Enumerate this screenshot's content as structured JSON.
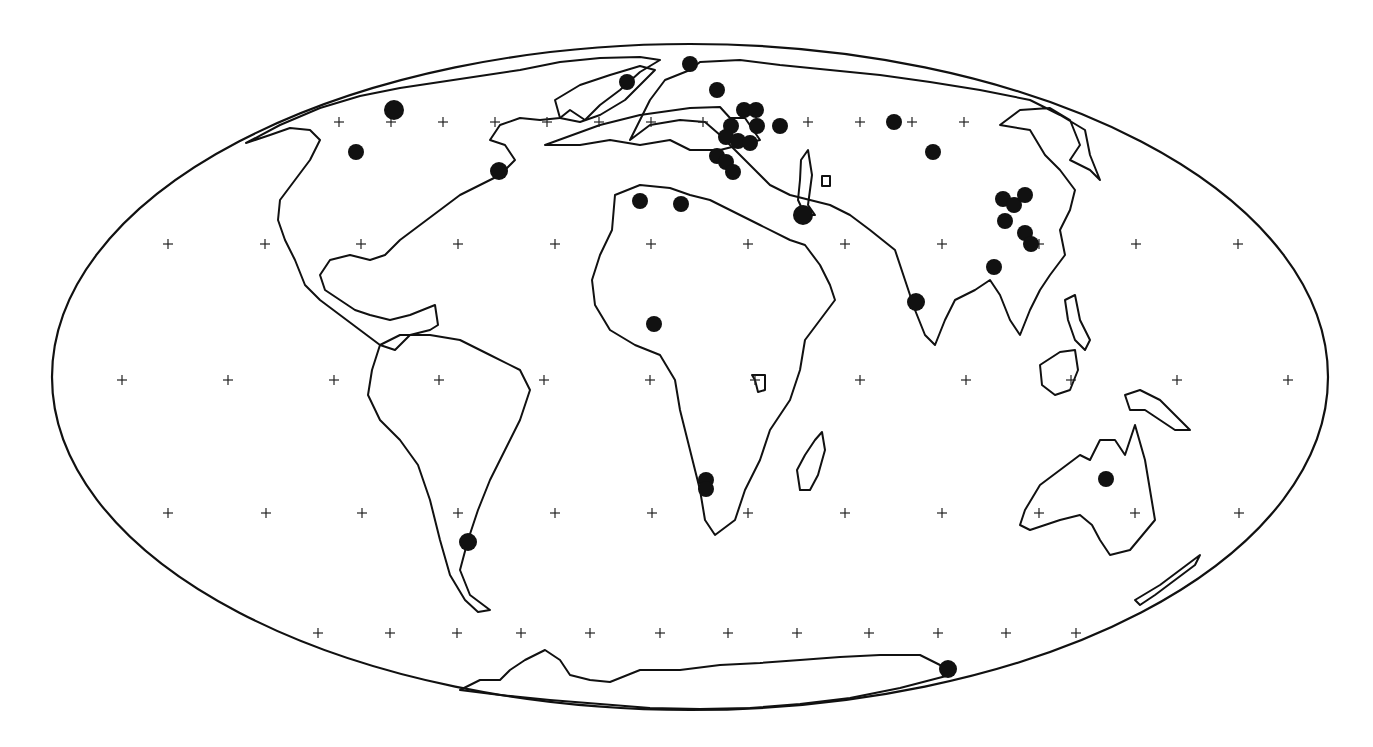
{
  "map": {
    "projection": "Mollweide",
    "width": 1373,
    "height": 747,
    "background": "#ffffff",
    "ink_color": "#111111",
    "outline": {
      "cx": 690,
      "cy": 377,
      "rx": 638,
      "ry": 333
    },
    "graticule_markers": {
      "rows": [
        {
          "y": 122,
          "x": [
            339,
            391,
            443,
            495,
            547,
            599,
            651,
            703,
            756,
            808,
            860,
            912,
            964
          ]
        },
        {
          "y": 244,
          "x": [
            168,
            265,
            361,
            458,
            555,
            651,
            748,
            845,
            942,
            1039,
            1136,
            1238
          ]
        },
        {
          "y": 380,
          "x": [
            122,
            228,
            334,
            439,
            544,
            650,
            755,
            860,
            966,
            1071,
            1177,
            1288
          ]
        },
        {
          "y": 513,
          "x": [
            168,
            266,
            362,
            458,
            555,
            652,
            748,
            845,
            942,
            1039,
            1135,
            1239
          ]
        },
        {
          "y": 633,
          "x": [
            318,
            390,
            457,
            521,
            590,
            660,
            728,
            797,
            869,
            938,
            1006,
            1076
          ]
        }
      ]
    },
    "sites": [
      {
        "region": "Alaska/NW Canada",
        "x": 394,
        "y": 110,
        "r": 10
      },
      {
        "region": "Western Canada",
        "x": 356,
        "y": 152,
        "r": 8
      },
      {
        "region": "Eastern Canada",
        "x": 499,
        "y": 171,
        "r": 9
      },
      {
        "region": "Greenland",
        "x": 627,
        "y": 82,
        "r": 8
      },
      {
        "region": "Svalbard",
        "x": 690,
        "y": 64,
        "r": 8
      },
      {
        "region": "Scandinavia",
        "x": 717,
        "y": 90,
        "r": 8
      },
      {
        "region": "Russia W1",
        "x": 744,
        "y": 110,
        "r": 8
      },
      {
        "region": "Russia W2",
        "x": 756,
        "y": 110,
        "r": 8
      },
      {
        "region": "Baltic 1",
        "x": 731,
        "y": 126,
        "r": 8
      },
      {
        "region": "Russia W3",
        "x": 757,
        "y": 126,
        "r": 8
      },
      {
        "region": "Moscow area",
        "x": 780,
        "y": 126,
        "r": 8
      },
      {
        "region": "Baltic 2",
        "x": 726,
        "y": 137,
        "r": 8
      },
      {
        "region": "Baltic 3",
        "x": 738,
        "y": 141,
        "r": 8
      },
      {
        "region": "Russia W4",
        "x": 750,
        "y": 143,
        "r": 8
      },
      {
        "region": "Ukraine 1",
        "x": 717,
        "y": 156,
        "r": 8
      },
      {
        "region": "Ukraine 2",
        "x": 726,
        "y": 162,
        "r": 8
      },
      {
        "region": "Ukraine 3",
        "x": 733,
        "y": 172,
        "r": 8
      },
      {
        "region": "Spain",
        "x": 640,
        "y": 201,
        "r": 8
      },
      {
        "region": "Italy/Tunisia",
        "x": 681,
        "y": 204,
        "r": 8
      },
      {
        "region": "Caspian/Iran",
        "x": 803,
        "y": 215,
        "r": 10
      },
      {
        "region": "West Siberia",
        "x": 894,
        "y": 122,
        "r": 8
      },
      {
        "region": "Central Siberia",
        "x": 933,
        "y": 152,
        "r": 8
      },
      {
        "region": "North China 1",
        "x": 1003,
        "y": 199,
        "r": 8
      },
      {
        "region": "North China 2",
        "x": 1014,
        "y": 205,
        "r": 8
      },
      {
        "region": "NE China",
        "x": 1025,
        "y": 195,
        "r": 8
      },
      {
        "region": "China central",
        "x": 1005,
        "y": 221,
        "r": 8
      },
      {
        "region": "East China 1",
        "x": 1025,
        "y": 233,
        "r": 8
      },
      {
        "region": "East China 2",
        "x": 1031,
        "y": 244,
        "r": 8
      },
      {
        "region": "South China",
        "x": 994,
        "y": 267,
        "r": 8
      },
      {
        "region": "India",
        "x": 916,
        "y": 302,
        "r": 9
      },
      {
        "region": "West Africa",
        "x": 654,
        "y": 324,
        "r": 8
      },
      {
        "region": "Namibia 1",
        "x": 706,
        "y": 480,
        "r": 8
      },
      {
        "region": "Namibia 2",
        "x": 706,
        "y": 489,
        "r": 8
      },
      {
        "region": "Australia",
        "x": 1106,
        "y": 479,
        "r": 8
      },
      {
        "region": "Argentina",
        "x": 468,
        "y": 542,
        "r": 9
      },
      {
        "region": "Antarctica",
        "x": 948,
        "y": 669,
        "r": 9
      }
    ],
    "coastlines": [
      "M 545 145 L 600 125 L 640 115 L 690 108 L 720 107 L 730 118 L 745 118 L 760 140 L 720 150 L 690 150 L 670 140 L 640 145 L 610 140 L 580 145 Z",
      "M 246 143 L 280 125 L 320 108 L 360 96 L 400 88 L 440 82 L 480 76 L 520 70 L 560 62 L 600 58 L 640 57 L 660 60 L 640 72 L 620 90 L 600 105 L 585 120 L 570 110 L 560 118 L 540 120 L 520 118 L 500 125 L 490 140 L 505 145 L 515 160 L 500 175 L 480 185 L 460 195 L 440 210 L 420 225 L 400 240 L 385 255 L 370 260 L 350 255 L 330 260 L 320 275 L 325 290 L 340 300 L 355 310 L 370 315 L 390 320 L 410 315 L 435 305 L 438 325 L 430 330 L 410 335 L 395 350 L 380 345 L 360 330 L 340 315 L 320 300 L 305 285 L 295 260 L 285 240 L 278 220 L 280 200 L 295 180 L 310 160 L 320 140 L 310 130 L 290 128 L 270 135 Z",
      "M 555 100 L 580 85 L 610 75 L 640 66 L 655 70 L 640 85 L 625 100 L 600 115 L 580 122 L 560 118 Z",
      "M 380 345 L 400 335 L 430 335 L 460 340 L 490 355 L 520 370 L 530 390 L 520 420 L 505 450 L 490 480 L 478 510 L 468 540 L 460 570 L 470 595 L 490 610 L 478 612 L 465 600 L 450 575 L 440 540 L 430 500 L 418 465 L 400 440 L 380 420 L 368 395 L 372 370 Z",
      "M 630 140 L 650 125 L 680 120 L 705 122 L 720 135 L 735 150 L 755 170 L 770 185 L 790 195 L 810 200 L 830 205 L 850 215 L 870 230 L 895 250 L 905 280 L 915 310 L 925 335 L 935 345 L 945 320 L 955 300 L 975 290 L 990 280 L 1000 295 L 1010 320 L 1020 335 L 1030 310 L 1040 290 L 1050 275 L 1065 255 L 1060 230 L 1070 210 L 1075 190 L 1060 170 L 1045 155 L 1030 130 L 1000 125 L 1020 110 L 1050 108 L 1070 120 L 1080 145 L 1070 160 L 1090 170 L 1100 180 L 1090 155 L 1085 130 L 1060 115 L 1030 100 L 980 90 L 930 82 L 880 75 L 830 70 L 780 65 L 740 60 L 700 62 L 690 70 L 665 80 L 650 100 L 640 120 Z",
      "M 615 195 L 640 185 L 670 188 L 690 195 L 710 200 L 730 210 L 760 225 L 790 240 L 805 245 L 820 265 L 830 285 L 835 300 L 820 320 L 805 340 L 800 370 L 790 400 L 770 430 L 760 460 L 745 490 L 735 520 L 715 535 L 705 520 L 700 490 L 690 450 L 680 410 L 675 380 L 660 355 L 635 345 L 610 330 L 595 305 L 592 280 L 600 255 L 612 230 Z",
      "M 815 440 L 822 432 L 825 450 L 818 475 L 810 490 L 800 490 L 797 470 L 805 455 Z",
      "M 1025 510 L 1040 485 L 1060 470 L 1080 455 L 1090 460 L 1100 440 L 1115 440 L 1125 455 L 1135 425 L 1145 460 L 1150 490 L 1155 520 L 1130 550 L 1110 555 L 1100 540 L 1092 525 L 1080 515 L 1060 520 L 1045 525 L 1030 530 L 1020 525 Z",
      "M 1125 395 L 1140 390 L 1160 400 L 1175 415 L 1190 430 L 1175 430 L 1160 420 L 1145 410 L 1130 410 Z",
      "M 1040 365 L 1060 352 L 1075 350 L 1078 370 L 1070 390 L 1055 395 L 1042 385 Z",
      "M 1065 300 L 1075 295 L 1080 320 L 1090 340 L 1085 350 L 1075 340 L 1068 320 Z",
      "M 1135 600 L 1160 585 L 1180 570 L 1200 555 L 1195 565 L 1175 580 L 1155 595 L 1140 605 Z",
      "M 460 690 L 480 680 L 500 680 L 510 670 L 525 660 L 545 650 L 560 660 L 570 675 L 590 680 L 610 682 L 640 670 L 680 670 L 720 665 L 760 663 L 800 660 L 840 657 L 880 655 L 920 655 L 940 665 L 950 675 L 900 688 L 850 698 L 800 704 L 750 708 L 700 709 L 650 708 L 600 704 L 550 700 L 500 695 Z",
      "M 801 160 L 808 150 L 812 175 L 808 205 L 815 215 L 805 215 L 798 200 L 800 180 Z",
      "M 822 176 L 830 176 L 830 186 L 822 186 Z",
      "M 752 375 L 765 375 L 765 390 L 758 392 L 755 380 Z"
    ]
  }
}
